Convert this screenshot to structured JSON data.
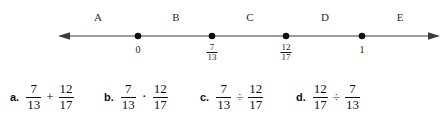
{
  "figure": {
    "type": "number-line",
    "axis": {
      "left_arrow_x": 58,
      "right_arrow_x": 440,
      "y": 36,
      "color": "#3b3b3b"
    },
    "region_labels": [
      {
        "label": "A",
        "x": 98,
        "y": 12
      },
      {
        "label": "B",
        "x": 176,
        "y": 12
      },
      {
        "label": "C",
        "x": 250,
        "y": 12
      },
      {
        "label": "D",
        "x": 325,
        "y": 12
      },
      {
        "label": "E",
        "x": 400,
        "y": 12
      }
    ],
    "points": [
      {
        "id": "zero",
        "x": 138,
        "kind": "whole",
        "value": "0",
        "numerator": "",
        "denominator": ""
      },
      {
        "id": "seven13",
        "x": 212,
        "kind": "fraction",
        "value": "",
        "numerator": "7",
        "denominator": "13"
      },
      {
        "id": "twelve17",
        "x": 286,
        "kind": "fraction",
        "value": "",
        "numerator": "12",
        "denominator": "17"
      },
      {
        "id": "one",
        "x": 362,
        "kind": "whole",
        "value": "1",
        "numerator": "",
        "denominator": ""
      }
    ]
  },
  "choices": [
    {
      "letter": "a.",
      "x": 10,
      "left": {
        "numerator": "7",
        "denominator": "13"
      },
      "operator": "+",
      "operator_name": "plus",
      "right": {
        "numerator": "12",
        "denominator": "17"
      }
    },
    {
      "letter": "b.",
      "x": 104,
      "left": {
        "numerator": "7",
        "denominator": "13"
      },
      "operator": "·",
      "operator_name": "multiply-dot",
      "right": {
        "numerator": "12",
        "denominator": "17"
      }
    },
    {
      "letter": "c.",
      "x": 200,
      "left": {
        "numerator": "7",
        "denominator": "13"
      },
      "operator": "÷",
      "operator_name": "divide",
      "right": {
        "numerator": "12",
        "denominator": "17"
      }
    },
    {
      "letter": "d.",
      "x": 296,
      "left": {
        "numerator": "12",
        "denominator": "17"
      },
      "operator": "÷",
      "operator_name": "divide",
      "right": {
        "numerator": "7",
        "denominator": "13"
      }
    }
  ]
}
